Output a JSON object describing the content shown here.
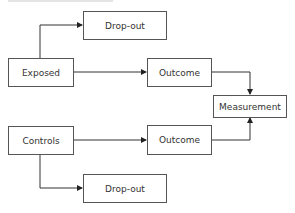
{
  "diagram": {
    "nodes": {
      "dropout_top": "Drop-out",
      "exposed": "Exposed",
      "outcome_top": "Outcome",
      "measurement": "Measurement",
      "controls": "Controls",
      "outcome_bottom": "Outcome",
      "dropout_bottom": "Drop-out"
    },
    "edges": [
      {
        "from": "exposed",
        "to": "dropout_top"
      },
      {
        "from": "exposed",
        "to": "outcome_top"
      },
      {
        "from": "outcome_top",
        "to": "measurement"
      },
      {
        "from": "controls",
        "to": "outcome_bottom"
      },
      {
        "from": "outcome_bottom",
        "to": "measurement"
      },
      {
        "from": "controls",
        "to": "dropout_bottom"
      }
    ],
    "colors": {
      "line": "#333333",
      "border": "#555555",
      "text": "#333333"
    }
  }
}
